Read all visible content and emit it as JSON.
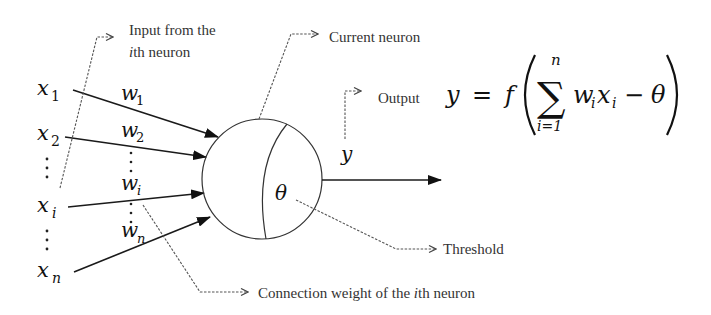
{
  "diagram": {
    "type": "artificial-neuron-model",
    "inputs": [
      {
        "symbol": "x",
        "sub": "1"
      },
      {
        "symbol": "x",
        "sub": "2"
      },
      {
        "symbol": "x",
        "sub": "i"
      },
      {
        "symbol": "x",
        "sub": "n"
      }
    ],
    "weights": [
      {
        "symbol": "w",
        "sub": "1"
      },
      {
        "symbol": "w",
        "sub": "2"
      },
      {
        "symbol": "w",
        "sub": "i"
      },
      {
        "symbol": "w",
        "sub": "n"
      }
    ],
    "vertical_ellipsis": "⋮",
    "threshold_symbol": "θ",
    "output_symbol": "y",
    "annotations": {
      "input_from": {
        "line1": "Input from the",
        "line2_italic": "i",
        "line2_rest": "th neuron"
      },
      "current_neuron": "Current neuron",
      "output": "Output",
      "threshold": "Threshold",
      "connection_weight": {
        "prefix": "Connection weight of the ",
        "italic": "i",
        "suffix": "th neuron"
      }
    },
    "formula": {
      "lhs": "y",
      "equals": "=",
      "func": "f",
      "sum_symbol": "∑",
      "sum_upper": "n",
      "sum_lower": "i=1",
      "term_w": "w",
      "term_w_sub": "i",
      "term_x": "x",
      "term_x_sub": "i",
      "minus": "−",
      "theta": "θ",
      "text": "y = f( Σ_{i=1}^{n} w_i x_i − θ )"
    }
  }
}
